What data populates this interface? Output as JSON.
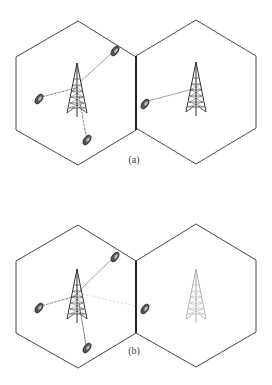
{
  "figures": [
    {
      "id": "a",
      "caption": "(a)",
      "description": "Two adjacent hexagonal cells, each with a base station tower; mobiles connect to their own cell's tower",
      "cells": [
        {
          "name": "left-cell",
          "tower_state": "active",
          "mobiles": 3
        },
        {
          "name": "right-cell",
          "tower_state": "active",
          "mobiles": 1
        }
      ]
    },
    {
      "id": "b",
      "caption": "(b)",
      "description": "Right cell tower inactive (faded); mobile near boundary links back to left cell tower",
      "cells": [
        {
          "name": "left-cell",
          "tower_state": "active",
          "mobiles": 3
        },
        {
          "name": "right-cell",
          "tower_state": "inactive",
          "mobiles": 1
        }
      ]
    }
  ],
  "colors": {
    "line": "#333333",
    "link": "#777777",
    "faded_tower": "#b0b0b0",
    "faded_link": "#c8c8c8"
  }
}
